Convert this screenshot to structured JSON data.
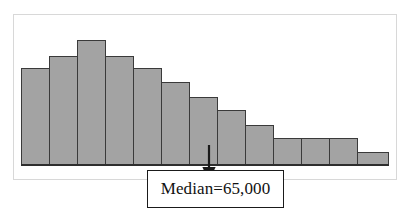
{
  "figure": {
    "type": "histogram-figure",
    "background_color": "#ffffff",
    "frame_color": "#d8d8d8",
    "bar_fill_color": "#a3a3a3",
    "bar_border_color": "#3a3a3a",
    "baseline_color": "#2e2e2e"
  },
  "annotation": {
    "median_label": "Median=65,000",
    "arrow_icon": "down-arrow-icon",
    "box_border_color": "#1a1a1a",
    "points_to_bin_index": 7
  },
  "chart_data": {
    "type": "bar",
    "title": "",
    "subtitle": "",
    "xlabel": "",
    "ylabel": "",
    "grid": false,
    "legend": false,
    "axis_ticks": false,
    "tick_labels": [],
    "legend_entries": [],
    "annotations": [
      {
        "text": "Median=65,000",
        "kind": "callout-box-with-arrow",
        "target_bin_index": 7
      }
    ],
    "bin_count": 13,
    "categories": [
      "1",
      "2",
      "3",
      "4",
      "5",
      "6",
      "7",
      "8",
      "9",
      "10",
      "11",
      "12",
      "13"
    ],
    "values": [
      97,
      109,
      125,
      109,
      97,
      83,
      68,
      55,
      40,
      27,
      27,
      27,
      13
    ],
    "ylim": [
      0,
      135
    ],
    "xlim": [
      0,
      13
    ],
    "series": [
      {
        "name": "frequency",
        "values": [
          97,
          109,
          125,
          109,
          97,
          83,
          68,
          55,
          40,
          27,
          27,
          27,
          13
        ]
      }
    ],
    "shape_description": "right-skewed unimodal distribution"
  },
  "bars": [
    {
      "index": 0,
      "x": 21,
      "top": 68,
      "width": 29,
      "height": 97
    },
    {
      "index": 1,
      "x": 49,
      "top": 56,
      "width": 29,
      "height": 109
    },
    {
      "index": 2,
      "x": 77,
      "top": 40,
      "width": 29,
      "height": 125
    },
    {
      "index": 3,
      "x": 105,
      "top": 56,
      "width": 29,
      "height": 109
    },
    {
      "index": 4,
      "x": 133,
      "top": 68,
      "width": 29,
      "height": 97
    },
    {
      "index": 5,
      "x": 161,
      "top": 82,
      "width": 29,
      "height": 83
    },
    {
      "index": 6,
      "x": 189,
      "top": 97,
      "width": 29,
      "height": 68
    },
    {
      "index": 7,
      "x": 217,
      "top": 110,
      "width": 29,
      "height": 55
    },
    {
      "index": 8,
      "x": 245,
      "top": 125,
      "width": 29,
      "height": 40
    },
    {
      "index": 9,
      "x": 273,
      "top": 138,
      "width": 29,
      "height": 27
    },
    {
      "index": 10,
      "x": 301,
      "top": 138,
      "width": 29,
      "height": 27
    },
    {
      "index": 11,
      "x": 329,
      "top": 138,
      "width": 29,
      "height": 27
    },
    {
      "index": 12,
      "x": 357,
      "top": 152,
      "width": 32,
      "height": 13
    }
  ]
}
